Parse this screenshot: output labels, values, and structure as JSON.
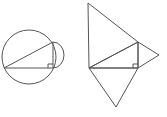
{
  "figures": [
    {
      "name": "right-triangle-with-circles",
      "description": "Right triangle inscribed with hypotenuse as diameter of large circle, semicircle on vertical leg",
      "right_angle_marker": true
    },
    {
      "name": "right-triangle-with-triangles",
      "description": "Right triangle with triangles constructed on each side",
      "right_angle_marker": true
    }
  ],
  "colors": {
    "stroke": "#555555",
    "background": "#ffffff"
  }
}
